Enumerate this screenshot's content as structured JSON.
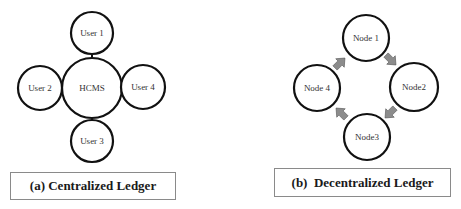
{
  "centralized": {
    "hub": {
      "label": "HCMS",
      "cx": 92,
      "cy": 88,
      "r": 30
    },
    "users": [
      {
        "label": "User 1",
        "cx": 92,
        "cy": 33,
        "r": 21
      },
      {
        "label": "User 2",
        "cx": 40,
        "cy": 88,
        "r": 22
      },
      {
        "label": "User 3",
        "cx": 92,
        "cy": 141,
        "r": 21
      },
      {
        "label": "User 4",
        "cx": 143,
        "cy": 87,
        "r": 22
      }
    ],
    "caption": "(a) Centralized Ledger"
  },
  "decentralized": {
    "nodes": [
      {
        "label": "Node 1",
        "cx": 366,
        "cy": 38,
        "r": 23
      },
      {
        "label": "Node2",
        "cx": 414,
        "cy": 87,
        "r": 24
      },
      {
        "label": "Node3",
        "cx": 367,
        "cy": 137,
        "r": 23
      },
      {
        "label": "Node 4",
        "cx": 317,
        "cy": 88,
        "r": 23
      }
    ],
    "caption": "(b)  Decentralized Ledger",
    "arrow_color": "#8c8c8c"
  },
  "colors": {
    "stroke": "#111111",
    "text": "#333333"
  }
}
